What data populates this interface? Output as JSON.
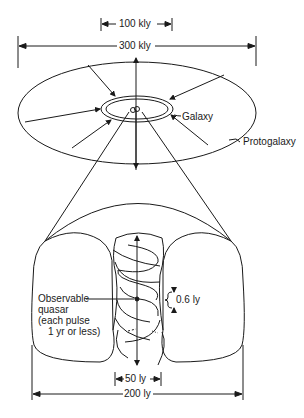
{
  "diagram": {
    "type": "scientific-illustration",
    "colors": {
      "ink": "#1a1a1a",
      "background": "#ffffff"
    },
    "top_view": {
      "dimension_inner": "100 kly",
      "dimension_outer": "300 kly",
      "labels": {
        "galaxy": "Galaxy",
        "protogalaxy": "Protogalaxy"
      }
    },
    "bottom_view": {
      "quasar_label": [
        "Observable",
        "quasar",
        "(each pulse",
        "1 yr or less)"
      ],
      "pulse_spacing": "0.6 ly",
      "dimension_jet": "50 ly",
      "dimension_outer": "200 ly"
    }
  }
}
